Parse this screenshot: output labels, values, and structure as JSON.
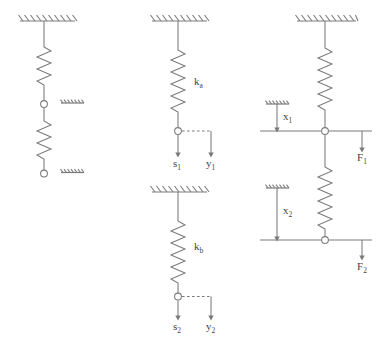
{
  "figure": {
    "background_color": "#ffffff",
    "line_color": "#7a7a7a",
    "text_color": "#444444",
    "node_fill": "#ffffff"
  },
  "panels": [
    {
      "id": "series-springs",
      "name": "Two springs in series fixed to ceiling",
      "supports": [
        "ceiling-hatch",
        "node-hatch-middle",
        "node-hatch-bottom"
      ],
      "springs": 2,
      "nodes": 2,
      "labels": []
    },
    {
      "id": "spring-ka",
      "name": "Single spring k_a with displacements",
      "supports": [
        "ceiling-hatch"
      ],
      "springs": 1,
      "nodes": 1,
      "labels": [
        {
          "key": "spring",
          "text": "k",
          "sub": "a"
        },
        {
          "key": "disp_s",
          "text": "s",
          "sub": "1"
        },
        {
          "key": "disp_y",
          "text": "y",
          "sub": "1"
        }
      ]
    },
    {
      "id": "spring-kb",
      "name": "Single spring k_b with displacements",
      "supports": [
        "ceiling-hatch"
      ],
      "springs": 1,
      "nodes": 1,
      "labels": [
        {
          "key": "spring",
          "text": "k",
          "sub": "b"
        },
        {
          "key": "disp_s",
          "text": "s",
          "sub": "2"
        },
        {
          "key": "disp_y",
          "text": "y",
          "sub": "2"
        }
      ]
    },
    {
      "id": "combined-forces",
      "name": "Series springs with applied forces",
      "supports": [
        "ceiling-hatch",
        "datum-hatch-x1",
        "datum-hatch-x2"
      ],
      "springs": 2,
      "nodes": 2,
      "labels": [
        {
          "key": "disp_x1",
          "text": "x",
          "sub": "1"
        },
        {
          "key": "force_f1",
          "text": "F",
          "sub": "1"
        },
        {
          "key": "disp_x2",
          "text": "x",
          "sub": "2"
        },
        {
          "key": "force_f2",
          "text": "F",
          "sub": "2"
        }
      ]
    }
  ],
  "annotations": {
    "k_a": {
      "text": "k",
      "sub": "a"
    },
    "k_b": {
      "text": "k",
      "sub": "b"
    },
    "s_1": {
      "text": "s",
      "sub": "1"
    },
    "y_1": {
      "text": "y",
      "sub": "1"
    },
    "s_2": {
      "text": "s",
      "sub": "2"
    },
    "y_2": {
      "text": "y",
      "sub": "2"
    },
    "x_1": {
      "text": "x",
      "sub": "1"
    },
    "x_2": {
      "text": "x",
      "sub": "2"
    },
    "F_1": {
      "text": "F",
      "sub": "1"
    },
    "F_2": {
      "text": "F",
      "sub": "2"
    }
  }
}
